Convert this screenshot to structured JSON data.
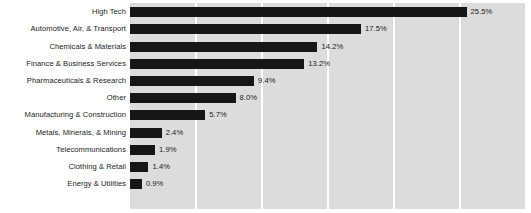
{
  "chart_data": {
    "type": "bar",
    "orientation": "horizontal",
    "title": "",
    "subtitle": "",
    "xlabel": "",
    "ylabel": "",
    "xlim": [
      0,
      30
    ],
    "grid": true,
    "gridline_values": [
      0,
      5,
      10,
      15,
      20,
      25,
      30
    ],
    "legend": null,
    "value_suffix": "%",
    "categories": [
      "High Tech",
      "Automotive, Air, & Transport",
      "Chemicals & Materials",
      "Finance & Business Services",
      "Pharmaceuticals & Research",
      "Other",
      "Manufacturing & Construction",
      "Metals, Minerals, & Mining",
      "Telecommunications",
      "Clothing & Retail",
      "Energy & Utilities"
    ],
    "values": [
      25.5,
      17.5,
      14.2,
      13.2,
      9.4,
      8.0,
      5.7,
      2.4,
      1.9,
      1.4,
      0.9
    ],
    "data_labels": [
      "25.5%",
      "17.5%",
      "14.2%",
      "13.2%",
      "9.4%",
      "8.0%",
      "5.7%",
      "2.4%",
      "1.9%",
      "1.4%",
      "0.9%"
    ],
    "colors": {
      "bar": "#161616",
      "plot_background": "#dcdcdc",
      "gridline": "#ffffff",
      "page_background": "#ffffff",
      "text": "#1b1b1b"
    }
  }
}
